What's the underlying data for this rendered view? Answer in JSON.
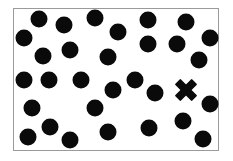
{
  "canvas": {
    "width": 233,
    "height": 161,
    "background": "#ffffff",
    "frame_color": "#9a9a9a",
    "mark_color": "#0a0a0a"
  },
  "dots": [
    {
      "x": 39,
      "y": 19
    },
    {
      "x": 64,
      "y": 25
    },
    {
      "x": 95,
      "y": 18
    },
    {
      "x": 148,
      "y": 20
    },
    {
      "x": 186,
      "y": 22
    },
    {
      "x": 24,
      "y": 38
    },
    {
      "x": 118,
      "y": 32
    },
    {
      "x": 210,
      "y": 38
    },
    {
      "x": 148,
      "y": 44
    },
    {
      "x": 177,
      "y": 44
    },
    {
      "x": 43,
      "y": 56
    },
    {
      "x": 70,
      "y": 50
    },
    {
      "x": 108,
      "y": 57
    },
    {
      "x": 199,
      "y": 60
    },
    {
      "x": 24,
      "y": 80
    },
    {
      "x": 49,
      "y": 80
    },
    {
      "x": 81,
      "y": 80
    },
    {
      "x": 135,
      "y": 80
    },
    {
      "x": 113,
      "y": 90
    },
    {
      "x": 155,
      "y": 93
    },
    {
      "x": 32,
      "y": 108
    },
    {
      "x": 95,
      "y": 108
    },
    {
      "x": 210,
      "y": 104
    },
    {
      "x": 50,
      "y": 127
    },
    {
      "x": 28,
      "y": 137
    },
    {
      "x": 70,
      "y": 140
    },
    {
      "x": 108,
      "y": 132
    },
    {
      "x": 149,
      "y": 128
    },
    {
      "x": 183,
      "y": 121
    },
    {
      "x": 203,
      "y": 139
    }
  ],
  "cross": {
    "x": 186,
    "y": 90
  }
}
